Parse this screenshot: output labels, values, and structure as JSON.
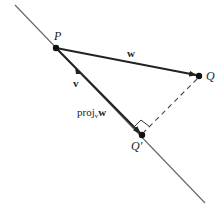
{
  "diagram": {
    "points": {
      "P": {
        "label": "P",
        "x": 56,
        "y": 48
      },
      "Q": {
        "label": "Q",
        "x": 199,
        "y": 76
      },
      "Qprime": {
        "label": "Q′",
        "x": 142,
        "y": 135
      }
    },
    "line": {
      "x1": 15,
      "y1": 5,
      "x2": 205,
      "y2": 203,
      "color": "#555555"
    },
    "vectors": {
      "w": {
        "label": "w",
        "from": "P",
        "to": "Q"
      },
      "v": {
        "label": "v"
      },
      "proj": {
        "label_main": "proj",
        "label_sub": "v",
        "label_vec": "w",
        "from": "P",
        "to": "Qprime"
      }
    },
    "perpendicular": {
      "style": "dashed",
      "from": "Q",
      "to": "Qprime",
      "right_angle_marker": true
    },
    "colors": {
      "vector": "#222222",
      "dashed": "#444444",
      "point": "#111111"
    }
  }
}
